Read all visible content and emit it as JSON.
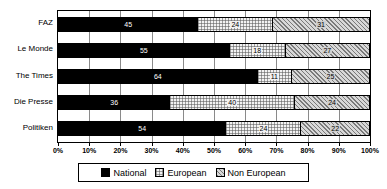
{
  "chart_data": {
    "type": "bar",
    "orientation": "horizontal",
    "stacked": true,
    "normalized_percent": true,
    "title": "",
    "subtitle": "",
    "xlabel": "",
    "ylabel": "",
    "xlim": [
      0,
      100
    ],
    "grid": true,
    "legend_position": "bottom",
    "categories": [
      "FAZ",
      "Le Monde",
      "The Times",
      "Die Presse",
      "Politiken"
    ],
    "xticks": [
      0,
      10,
      20,
      30,
      40,
      50,
      60,
      70,
      80,
      90,
      100
    ],
    "xtick_labels": [
      "0%",
      "10%",
      "20%",
      "30%",
      "40%",
      "50%",
      "60%",
      "70%",
      "80%",
      "90%",
      "100%"
    ],
    "series": [
      {
        "name": "National",
        "color": "#000000",
        "pattern": "solid",
        "values": [
          45,
          55,
          64,
          36,
          54
        ]
      },
      {
        "name": "European",
        "color": "#f2f2f2",
        "pattern": "dotted",
        "values": [
          24,
          18,
          11,
          40,
          24
        ]
      },
      {
        "name": "Non European",
        "color": "#c9c9c9",
        "pattern": "hatch",
        "values": [
          31,
          27,
          25,
          24,
          22
        ]
      }
    ],
    "rows": [
      {
        "category": "FAZ",
        "National": 45,
        "European": 24,
        "Non European": 31
      },
      {
        "category": "Le Monde",
        "National": 55,
        "European": 18,
        "Non European": 27
      },
      {
        "category": "The Times",
        "National": 64,
        "European": 11,
        "Non European": 25
      },
      {
        "category": "Die Presse",
        "National": 36,
        "European": 40,
        "Non European": 24
      },
      {
        "category": "Politiken",
        "National": 54,
        "European": 24,
        "Non European": 22
      }
    ]
  },
  "legend": {
    "items": [
      {
        "label": "National"
      },
      {
        "label": "European"
      },
      {
        "label": "Non European"
      }
    ]
  }
}
